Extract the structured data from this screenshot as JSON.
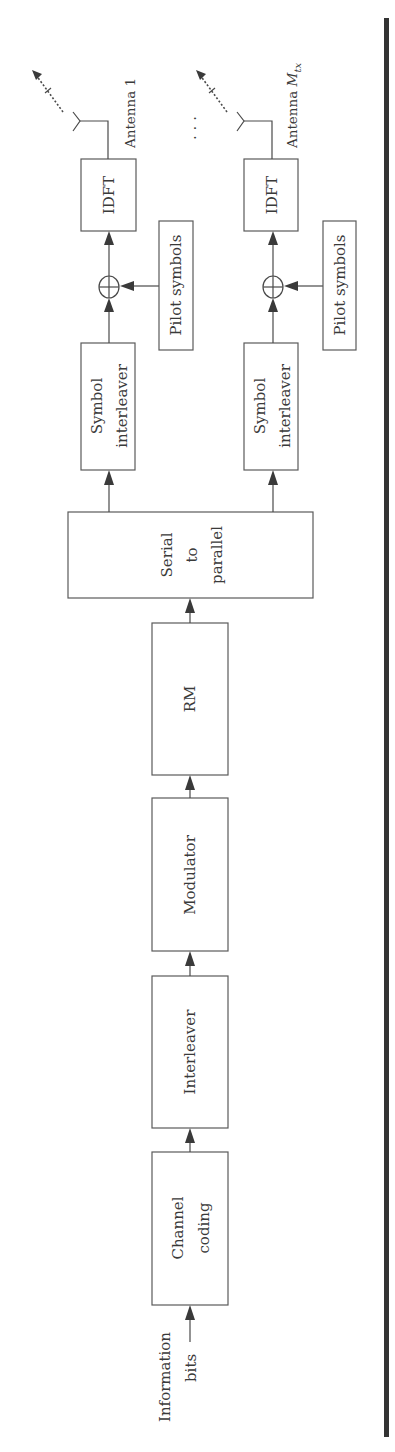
{
  "diagram": {
    "type": "block-diagram",
    "orientation": "rotated-90-ccw",
    "input_label": {
      "line1": "Information",
      "line2": "bits"
    },
    "blocks": {
      "channel_coding": {
        "line1": "Channel",
        "line2": "coding"
      },
      "interleaver": "Interleaver",
      "modulator": "Modulator",
      "rm": "RM",
      "serial_to_parallel": {
        "line1": "Serial",
        "line2": "to",
        "line3": "parallel"
      }
    },
    "branches": [
      {
        "symbol_interleaver": {
          "line1": "Symbol",
          "line2": "interleaver"
        },
        "pilot": "Pilot symbols",
        "idft": "IDFT",
        "antenna": "Antenna 1"
      },
      {
        "symbol_interleaver": {
          "line1": "Symbol",
          "line2": "interleaver"
        },
        "pilot": "Pilot symbols",
        "idft": "IDFT",
        "antenna_prefix": "Antenna ",
        "antenna_var": "M",
        "antenna_sub": "tx"
      }
    ],
    "ellipsis": "⋮",
    "flow": [
      "Information bits",
      "Channel coding",
      "Interleaver",
      "Modulator",
      "RM",
      "Serial to parallel",
      "Symbol interleaver",
      "Pilot symbols (added)",
      "IDFT",
      "Antenna"
    ],
    "colors": {
      "line": "#4a4a4a",
      "text": "#3a3a3a",
      "rule": "#333333"
    }
  }
}
